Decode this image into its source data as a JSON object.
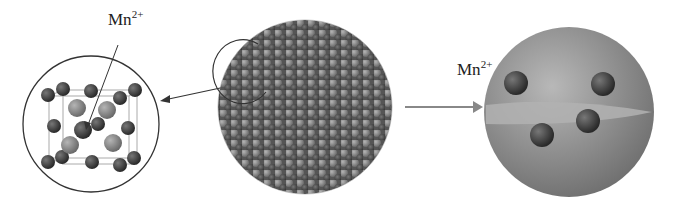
{
  "labels": {
    "crystal_ion": {
      "base": "Mn",
      "charge": "2+"
    },
    "dot_ion": {
      "base": "Mn",
      "charge": "2+"
    }
  },
  "panels": [
    "unit-cell-inset",
    "nanocrystal-cluster",
    "doped-quantum-dot"
  ],
  "colors": {
    "dark_atom": "#3a3a3a",
    "light_atom": "#8a8a8a",
    "sphere": "#9a9a9a",
    "arrow": "#888888",
    "line": "#333333"
  }
}
